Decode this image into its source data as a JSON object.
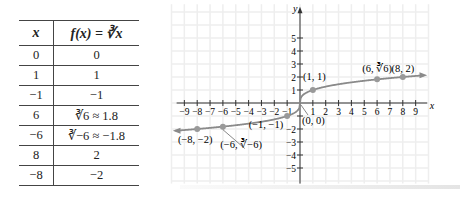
{
  "table": {
    "headers": [
      "x",
      "f(x) = ∛x"
    ],
    "rows": [
      [
        "0",
        "0"
      ],
      [
        "1",
        "1"
      ],
      [
        "−1",
        "−1"
      ],
      [
        "6",
        "∛6 ≈ 1.8"
      ],
      [
        "−6",
        "∛−6 ≈ −1.8"
      ],
      [
        "8",
        "2"
      ],
      [
        "−8",
        "−2"
      ]
    ]
  },
  "chart_data": {
    "type": "line",
    "title": "",
    "function": "f(x) = ∛x",
    "xlabel": "x",
    "ylabel": "y",
    "xlim": [
      -9.5,
      10
    ],
    "ylim": [
      -6,
      7
    ],
    "grid": true,
    "x_ticks": [
      -9,
      -8,
      -7,
      -6,
      -5,
      -4,
      -3,
      -2,
      -1,
      1,
      2,
      3,
      4,
      5,
      6,
      7,
      8,
      9
    ],
    "y_ticks": [
      -5,
      -4,
      -3,
      -2,
      -1,
      1,
      2,
      3,
      4,
      5
    ],
    "points": [
      {
        "x": -8,
        "y": -2,
        "label": "(−8, −2)"
      },
      {
        "x": -6,
        "y": -1.82,
        "label": "(−6, ∛−6)"
      },
      {
        "x": -1,
        "y": -1,
        "label": "(−1, −1)"
      },
      {
        "x": 0,
        "y": 0,
        "label": "(0, 0)"
      },
      {
        "x": 1,
        "y": 1,
        "label": "(1, 1)"
      },
      {
        "x": 6,
        "y": 1.82,
        "label": "(6, ∛6)"
      },
      {
        "x": 8,
        "y": 2,
        "label": "(8, 2)"
      }
    ],
    "curve_color": "#8a8a8a",
    "point_color": "#999999",
    "grid_color": "#eeeeee",
    "axis_color": "#333333"
  }
}
